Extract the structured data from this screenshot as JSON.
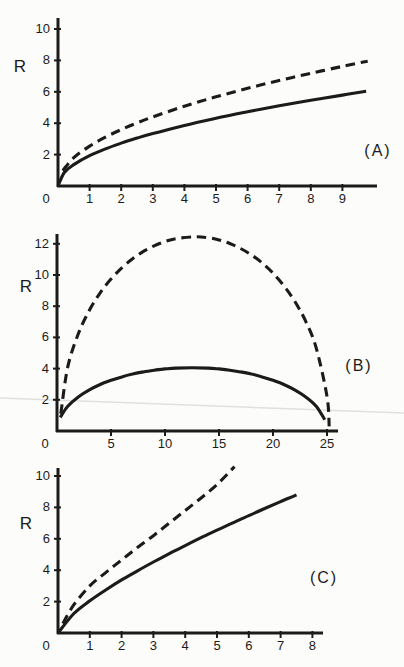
{
  "figure": {
    "ink_color": "#1b1b1b",
    "background_color": "#fcfcfa",
    "artifact_line_color": "#e1e1dc",
    "ylabel": "R"
  },
  "chart_data": [
    {
      "id": "A",
      "type": "line",
      "panel_label": "(A)",
      "ylabel": "R",
      "xlabel": "",
      "grid": false,
      "xlim": [
        0,
        10.1
      ],
      "ylim": [
        0,
        10.7
      ],
      "x_ticks": [
        0,
        1,
        2,
        3,
        4,
        5,
        6,
        7,
        8,
        9
      ],
      "y_ticks": [
        2,
        4,
        6,
        8,
        10
      ],
      "series": [
        {
          "name": "solid-curve",
          "style": "solid",
          "x": [
            0,
            0.2,
            0.5,
            1,
            1.5,
            2,
            2.5,
            3,
            4,
            5,
            6,
            7,
            8,
            9,
            9.75
          ],
          "y": [
            0,
            0.86,
            1.36,
            1.93,
            2.36,
            2.73,
            3.05,
            3.34,
            3.86,
            4.32,
            4.73,
            5.11,
            5.46,
            5.79,
            6.03
          ]
        },
        {
          "name": "dashed-curve",
          "style": "dashed",
          "x": [
            0.15,
            0.5,
            1,
            1.5,
            2,
            2.5,
            3,
            4,
            5,
            6,
            7,
            8,
            9,
            9.8
          ],
          "y": [
            0.98,
            1.8,
            2.54,
            3.11,
            3.59,
            4.02,
            4.4,
            5.08,
            5.68,
            6.22,
            6.72,
            7.18,
            7.62,
            7.95
          ]
        }
      ]
    },
    {
      "id": "B",
      "type": "line",
      "panel_label": "(B)",
      "ylabel": "R",
      "xlabel": "",
      "grid": false,
      "xlim": [
        0,
        26
      ],
      "ylim": [
        0,
        12.7
      ],
      "x_ticks": [
        0,
        5,
        10,
        15,
        20,
        25
      ],
      "y_ticks": [
        2,
        4,
        6,
        8,
        10,
        12
      ],
      "series": [
        {
          "name": "solid-curve",
          "style": "solid",
          "x": [
            0.3,
            1,
            2,
            3,
            4,
            5,
            6,
            7,
            8,
            9,
            10,
            11,
            12.5,
            14,
            15,
            16,
            17,
            18,
            19,
            20,
            21,
            22,
            23,
            24,
            24.8
          ],
          "y": [
            0.88,
            1.59,
            2.2,
            2.64,
            2.98,
            3.25,
            3.47,
            3.65,
            3.79,
            3.9,
            3.98,
            4.03,
            4.06,
            4.03,
            3.98,
            3.9,
            3.79,
            3.65,
            3.47,
            3.25,
            2.98,
            2.64,
            2.2,
            1.59,
            0.72
          ]
        },
        {
          "name": "dashed-curve",
          "style": "dashed",
          "x": [
            0.35,
            1,
            2,
            3,
            4,
            5,
            6,
            7,
            8,
            9,
            10,
            11,
            12.75,
            14,
            15,
            16,
            17,
            18,
            19,
            20,
            21,
            22,
            23,
            24,
            25,
            25.2
          ],
          "y": [
            1.11,
            4.12,
            6.28,
            7.74,
            8.86,
            9.74,
            10.46,
            11.04,
            11.51,
            11.87,
            12.14,
            12.33,
            12.45,
            12.39,
            12.25,
            12.02,
            11.7,
            11.29,
            10.77,
            10.12,
            9.32,
            8.33,
            7.07,
            5.33,
            2.22,
            0.3
          ]
        }
      ]
    },
    {
      "id": "C",
      "type": "line",
      "panel_label": "(C)",
      "ylabel": "R",
      "xlabel": "",
      "grid": false,
      "xlim": [
        0,
        8.35
      ],
      "ylim": [
        0,
        10.5
      ],
      "x_ticks": [
        0,
        1,
        2,
        3,
        4,
        5,
        6,
        7,
        8
      ],
      "y_ticks": [
        2,
        4,
        6,
        8,
        10
      ],
      "series": [
        {
          "name": "solid-curve",
          "style": "solid",
          "x": [
            0,
            0.5,
            1,
            1.5,
            2,
            2.5,
            3,
            3.5,
            4,
            4.5,
            5,
            5.5,
            6,
            6.5,
            7,
            7.5
          ],
          "y": [
            0,
            1.24,
            2.05,
            2.74,
            3.38,
            3.96,
            4.52,
            5.05,
            5.57,
            6.07,
            6.55,
            7.02,
            7.48,
            7.93,
            8.37,
            8.8
          ]
        },
        {
          "name": "dashed-curve",
          "style": "dashed",
          "x": [
            0.15,
            0.5,
            1,
            1.5,
            2,
            2.5,
            3,
            3.5,
            4,
            4.5,
            5,
            5.55
          ],
          "y": [
            0.6,
            1.8,
            3.0,
            3.85,
            4.65,
            5.45,
            6.2,
            7.0,
            7.8,
            8.6,
            9.45,
            10.6
          ]
        }
      ]
    }
  ]
}
